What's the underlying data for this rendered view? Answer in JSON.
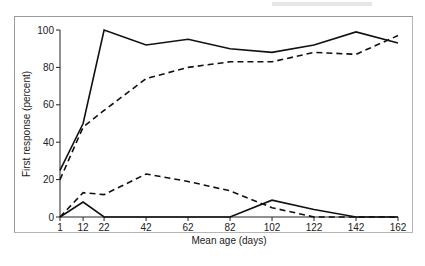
{
  "chart_data": {
    "type": "line",
    "title": "",
    "xlabel": "Mean age (days)",
    "ylabel": "First response (percent)",
    "x": [
      1,
      12,
      22,
      42,
      62,
      82,
      102,
      122,
      142,
      162
    ],
    "x_ticks": [
      "1",
      "12",
      "22",
      "42",
      "62",
      "82",
      "102",
      "122",
      "142",
      "162"
    ],
    "y_ticks": [
      "0",
      "20",
      "40",
      "60",
      "80",
      "100"
    ],
    "xlim": [
      1,
      162
    ],
    "ylim": [
      0,
      100
    ],
    "grid": false,
    "legend": null,
    "series": [
      {
        "name": "solid-upper",
        "style": "solid",
        "values": [
          25,
          50,
          100,
          92,
          95,
          90,
          88,
          92,
          99,
          93
        ]
      },
      {
        "name": "dashed-upper",
        "style": "dashed",
        "values": [
          20,
          48,
          57,
          74,
          80,
          83,
          83,
          88,
          87,
          97
        ]
      },
      {
        "name": "dashed-lower",
        "style": "dashed",
        "values": [
          0,
          13,
          12,
          23,
          19,
          14,
          5,
          0,
          0,
          0
        ]
      },
      {
        "name": "solid-lower",
        "style": "solid",
        "values": [
          0,
          8,
          0,
          0,
          0,
          0,
          9,
          4,
          0,
          0
        ]
      }
    ]
  }
}
